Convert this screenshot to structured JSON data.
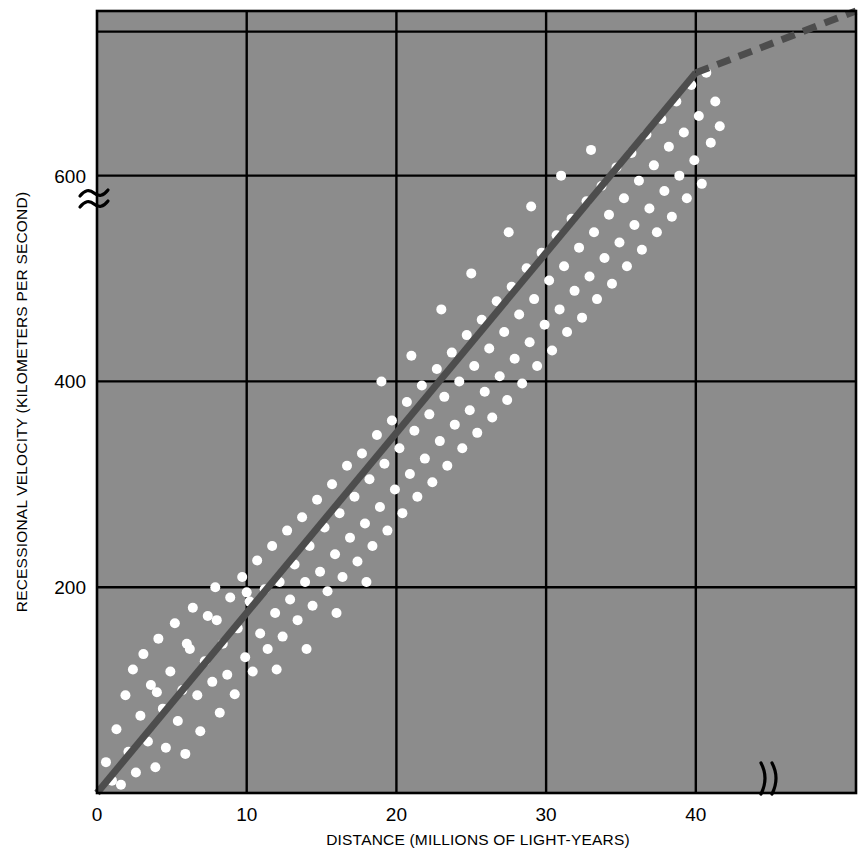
{
  "chart_data": {
    "type": "scatter",
    "title": "",
    "subtitle": "",
    "xlabel": "DISTANCE (MILLIONS OF LIGHT-YEARS)",
    "ylabel": "RECESSIONAL VELOCITY (KILOMETERS PER SECOND)",
    "xlim": [
      0,
      50.7
    ],
    "ylim": [
      0,
      760
    ],
    "xticks": [
      0,
      10,
      20,
      30,
      40
    ],
    "xtick_labels": [
      "0",
      "10",
      "20",
      "30",
      "40"
    ],
    "yticks": [
      200,
      400,
      600
    ],
    "ytick_labels": [
      "200",
      "400",
      "600"
    ],
    "grid": true,
    "grid_color": "#000000",
    "plot_background": "#8c8c8c",
    "page_background": "#ffffff",
    "point_color": "#ffffff",
    "point_radius_px": 5,
    "legend": null,
    "legend_position": "none",
    "axis_breaks": {
      "x_break_symbol": ")(",
      "x_break_at": 44.3,
      "y_break_symbol": "≈",
      "y_break_at": 700
    },
    "annotations": [],
    "series": [
      {
        "name": "Galaxies",
        "type": "scatter",
        "marker": "circle",
        "color": "#ffffff",
        "points": [
          [
            0.6,
            30
          ],
          [
            1.0,
            12
          ],
          [
            1.3,
            62
          ],
          [
            1.6,
            8
          ],
          [
            1.9,
            95
          ],
          [
            2.1,
            40
          ],
          [
            2.4,
            120
          ],
          [
            2.6,
            20
          ],
          [
            2.9,
            75
          ],
          [
            3.1,
            135
          ],
          [
            3.4,
            50
          ],
          [
            3.6,
            105
          ],
          [
            3.9,
            25
          ],
          [
            4.1,
            150
          ],
          [
            4.4,
            82
          ],
          [
            4.6,
            44
          ],
          [
            4.9,
            118
          ],
          [
            5.2,
            165
          ],
          [
            5.4,
            70
          ],
          [
            5.7,
            100
          ],
          [
            5.9,
            38
          ],
          [
            6.2,
            140
          ],
          [
            6.4,
            180
          ],
          [
            6.7,
            95
          ],
          [
            6.9,
            60
          ],
          [
            7.2,
            128
          ],
          [
            7.4,
            172
          ],
          [
            7.7,
            108
          ],
          [
            7.9,
            200
          ],
          [
            8.2,
            78
          ],
          [
            8.4,
            145
          ],
          [
            8.7,
            115
          ],
          [
            8.9,
            190
          ],
          [
            9.2,
            96
          ],
          [
            9.4,
            160
          ],
          [
            9.7,
            210
          ],
          [
            9.9,
            132
          ],
          [
            10.2,
            186
          ],
          [
            10.4,
            118
          ],
          [
            10.7,
            226
          ],
          [
            10.9,
            155
          ],
          [
            11.2,
            198
          ],
          [
            11.4,
            140
          ],
          [
            11.7,
            240
          ],
          [
            11.9,
            175
          ],
          [
            12.2,
            205
          ],
          [
            12.4,
            152
          ],
          [
            12.7,
            255
          ],
          [
            12.9,
            188
          ],
          [
            13.2,
            222
          ],
          [
            13.4,
            168
          ],
          [
            13.7,
            268
          ],
          [
            13.9,
            205
          ],
          [
            14.2,
            240
          ],
          [
            14.4,
            182
          ],
          [
            14.7,
            285
          ],
          [
            14.9,
            215
          ],
          [
            15.2,
            258
          ],
          [
            15.4,
            196
          ],
          [
            15.7,
            300
          ],
          [
            15.9,
            232
          ],
          [
            16.2,
            272
          ],
          [
            16.4,
            210
          ],
          [
            16.7,
            318
          ],
          [
            16.9,
            248
          ],
          [
            17.2,
            288
          ],
          [
            17.4,
            225
          ],
          [
            17.7,
            330
          ],
          [
            17.9,
            262
          ],
          [
            18.2,
            305
          ],
          [
            18.4,
            240
          ],
          [
            18.7,
            348
          ],
          [
            18.9,
            278
          ],
          [
            19.2,
            320
          ],
          [
            19.4,
            255
          ],
          [
            19.7,
            362
          ],
          [
            19.9,
            295
          ],
          [
            20.2,
            335
          ],
          [
            20.4,
            272
          ],
          [
            20.7,
            380
          ],
          [
            20.9,
            310
          ],
          [
            21.2,
            352
          ],
          [
            21.4,
            288
          ],
          [
            21.7,
            396
          ],
          [
            21.9,
            325
          ],
          [
            22.2,
            368
          ],
          [
            22.4,
            302
          ],
          [
            22.7,
            412
          ],
          [
            22.9,
            342
          ],
          [
            23.2,
            385
          ],
          [
            23.4,
            318
          ],
          [
            23.7,
            428
          ],
          [
            23.9,
            358
          ],
          [
            24.2,
            400
          ],
          [
            24.4,
            335
          ],
          [
            24.7,
            445
          ],
          [
            24.9,
            372
          ],
          [
            25.2,
            415
          ],
          [
            25.4,
            350
          ],
          [
            25.7,
            460
          ],
          [
            25.9,
            390
          ],
          [
            26.2,
            432
          ],
          [
            26.4,
            365
          ],
          [
            26.7,
            478
          ],
          [
            26.9,
            405
          ],
          [
            27.2,
            448
          ],
          [
            27.4,
            382
          ],
          [
            27.7,
            492
          ],
          [
            27.9,
            422
          ],
          [
            28.2,
            465
          ],
          [
            28.4,
            398
          ],
          [
            28.7,
            510
          ],
          [
            28.9,
            438
          ],
          [
            29.2,
            480
          ],
          [
            29.4,
            415
          ],
          [
            29.7,
            525
          ],
          [
            29.9,
            455
          ],
          [
            30.2,
            498
          ],
          [
            30.4,
            430
          ],
          [
            30.7,
            542
          ],
          [
            30.9,
            470
          ],
          [
            31.2,
            512
          ],
          [
            31.4,
            448
          ],
          [
            31.7,
            558
          ],
          [
            31.9,
            488
          ],
          [
            32.2,
            530
          ],
          [
            32.4,
            462
          ],
          [
            32.7,
            575
          ],
          [
            32.9,
            502
          ],
          [
            33.2,
            545
          ],
          [
            33.4,
            480
          ],
          [
            33.7,
            590
          ],
          [
            33.9,
            520
          ],
          [
            34.2,
            562
          ],
          [
            34.4,
            495
          ],
          [
            34.7,
            608
          ],
          [
            34.9,
            535
          ],
          [
            35.2,
            578
          ],
          [
            35.4,
            512
          ],
          [
            35.7,
            622
          ],
          [
            35.9,
            552
          ],
          [
            36.2,
            595
          ],
          [
            36.4,
            528
          ],
          [
            36.7,
            640
          ],
          [
            36.9,
            568
          ],
          [
            37.2,
            610
          ],
          [
            37.4,
            545
          ],
          [
            37.7,
            655
          ],
          [
            37.9,
            585
          ],
          [
            38.2,
            628
          ],
          [
            38.4,
            560
          ],
          [
            38.7,
            672
          ],
          [
            38.9,
            600
          ],
          [
            39.2,
            642
          ],
          [
            39.4,
            578
          ],
          [
            39.7,
            688
          ],
          [
            39.9,
            615
          ],
          [
            40.2,
            658
          ],
          [
            40.4,
            592
          ],
          [
            40.7,
            700
          ],
          [
            41.0,
            632
          ],
          [
            41.3,
            672
          ],
          [
            41.6,
            648
          ],
          [
            19.0,
            400
          ],
          [
            21.0,
            425
          ],
          [
            23.0,
            470
          ],
          [
            25.0,
            505
          ],
          [
            27.5,
            545
          ],
          [
            29.0,
            570
          ],
          [
            31.0,
            600
          ],
          [
            33.0,
            625
          ],
          [
            12.0,
            120
          ],
          [
            14.0,
            140
          ],
          [
            16.0,
            175
          ],
          [
            18.0,
            205
          ],
          [
            6.0,
            145
          ],
          [
            8.0,
            168
          ],
          [
            10.0,
            195
          ],
          [
            4.0,
            98
          ]
        ]
      }
    ],
    "fit_line": {
      "name": "Hubble relation (best fit)",
      "color": "#4d4d4d",
      "width_px": 7,
      "solid_segment": {
        "x0": 0.0,
        "y0": 0.0,
        "x1": 40.0,
        "y1": 700.0
      },
      "dashed_segment": {
        "x0": 40.0,
        "y0": 700.0,
        "x1": 50.7,
        "y1": 760.0
      },
      "dash_pattern": "14 9",
      "slope_km_s_per_mly": 17.5
    }
  },
  "figure": {
    "xlabel": "DISTANCE (MILLIONS OF LIGHT-YEARS)",
    "ylabel": "RECESSIONAL VELOCITY (KILOMETERS PER SECOND)",
    "x_break_symbol": ")(",
    "y_break_symbol": "≈"
  }
}
